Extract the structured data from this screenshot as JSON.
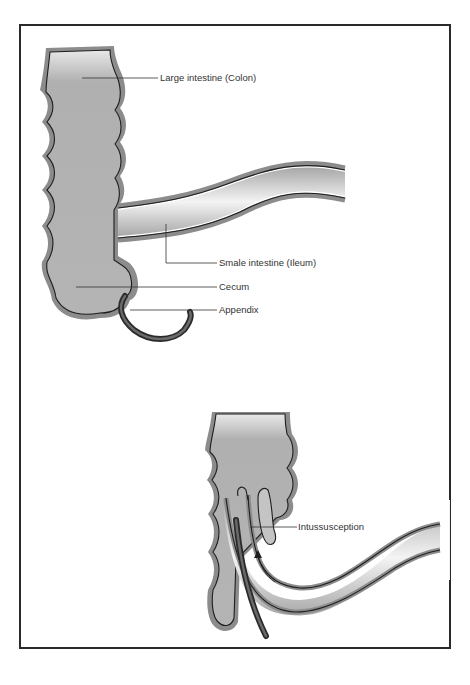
{
  "diagram": {
    "title": "",
    "figures": [
      {
        "id": "normal-anatomy",
        "labels": {
          "colon": "Large intestine (Colon)",
          "ileum": "Smale intestine (Ileum)",
          "cecum": "Cecum",
          "appendix": "Appendix"
        }
      },
      {
        "id": "intussusception",
        "labels": {
          "intussusception": "Intussusception"
        }
      }
    ],
    "colors": {
      "frame": "#2a2a2a",
      "tissue_fill": "#b8b8b8",
      "wall": "#8c8c8c",
      "outline": "#1e1e1e",
      "appendix": "#4a4a4a",
      "leader": "#333333"
    }
  }
}
